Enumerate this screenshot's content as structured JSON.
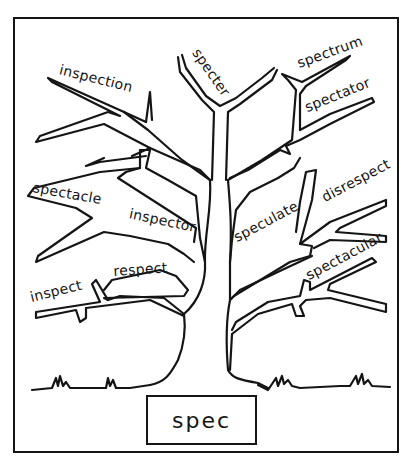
{
  "diagram": {
    "type": "word-tree",
    "root": {
      "label": "spec"
    },
    "ink_color": "#151515",
    "background": "#ffffff",
    "branches": {
      "left": [
        {
          "label": "inspection",
          "position": "upper-left"
        },
        {
          "label": "spectacle",
          "position": "middle-left"
        },
        {
          "label": "inspector",
          "position": "middle-left-inner"
        },
        {
          "label": "inspect",
          "position": "lower-left"
        },
        {
          "label": "respect",
          "position": "lower-left-inner"
        }
      ],
      "top": [
        {
          "label": "specter",
          "position": "top-center"
        },
        {
          "label": "spectrum",
          "position": "top-right"
        },
        {
          "label": "spectator",
          "position": "upper-right"
        }
      ],
      "right": [
        {
          "label": "speculate",
          "position": "middle-right-inner"
        },
        {
          "label": "disrespect",
          "position": "middle-right"
        },
        {
          "label": "spectacular",
          "position": "lower-right"
        }
      ]
    }
  }
}
